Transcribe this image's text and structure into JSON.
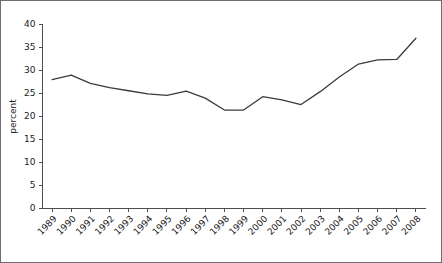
{
  "chart_data": {
    "type": "line",
    "title": "",
    "xlabel": "",
    "ylabel": "percent",
    "categories": [
      "1989",
      "1990",
      "1991",
      "1992",
      "1993",
      "1994",
      "1995",
      "1996",
      "1997",
      "1998",
      "1999",
      "2000",
      "2001",
      "2002",
      "2003",
      "2004",
      "2005",
      "2006",
      "2007",
      "2008"
    ],
    "values": [
      28.0,
      29.0,
      27.2,
      26.3,
      25.6,
      24.9,
      24.6,
      25.5,
      24.0,
      21.4,
      21.4,
      24.3,
      23.6,
      22.6,
      25.4,
      28.6,
      31.4,
      32.3,
      32.4,
      37.0
    ],
    "series": [
      {
        "name": "percent",
        "values": [
          28.0,
          29.0,
          27.2,
          26.3,
          25.6,
          24.9,
          24.6,
          25.5,
          24.0,
          21.4,
          21.4,
          24.3,
          23.6,
          22.6,
          25.4,
          28.6,
          31.4,
          32.3,
          32.4,
          37.0
        ]
      }
    ],
    "ylim": [
      0,
      40
    ],
    "yticks": [
      0,
      5,
      10,
      15,
      20,
      25,
      30,
      35,
      40
    ],
    "ytick_labels": [
      "0",
      "5",
      "10",
      "15",
      "20",
      "25",
      "30",
      "35",
      "40"
    ],
    "xtick_labels": [
      "1989",
      "1990",
      "1991",
      "1992",
      "1993",
      "1994",
      "1995",
      "1996",
      "1997",
      "1998",
      "1999",
      "2000",
      "2001",
      "2002",
      "2003",
      "2004",
      "2005",
      "2006",
      "2007",
      "2008"
    ],
    "xtick_rotation": 45,
    "grid": false,
    "legend": false,
    "legend_position": "none",
    "line_color": "#3b3b3b",
    "axis_color": "#4d4d4d",
    "background_color": "#ffffff",
    "border_color": "#6e6e6e"
  }
}
